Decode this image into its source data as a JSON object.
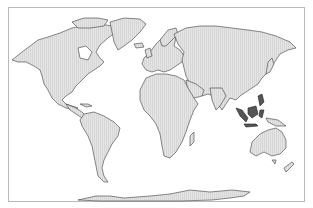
{
  "map": {
    "type": "world-map",
    "projection": "Robinson-like world projection",
    "land_color": "#dcdcdc",
    "outline_color": "#3a3a3a",
    "frame_color": "#b9b9b9",
    "highlight_color": "#555555",
    "highlighted_regions": [
      "Indonesia",
      "Malaysia",
      "Philippines"
    ],
    "labels": []
  }
}
